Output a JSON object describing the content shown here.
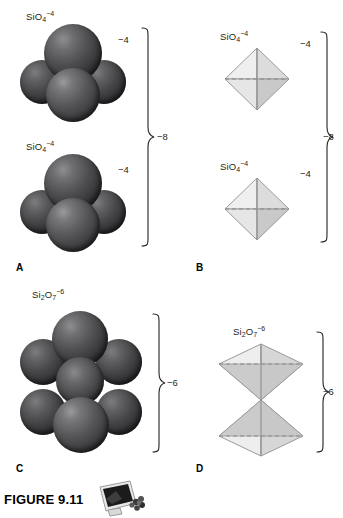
{
  "figure": {
    "caption_label": "FIGURE 9.11",
    "media_icon": "computer-monitor-icon"
  },
  "panels": [
    {
      "letter": "A",
      "kind": "space-filling-model",
      "units": [
        {
          "formula_html": "SiO<sub>4</sub><sup>−4</sup>",
          "charge": "−4"
        },
        {
          "formula_html": "SiO<sub>4</sub><sup>−4</sup>",
          "charge": "−4"
        }
      ],
      "group_charge": "−8"
    },
    {
      "letter": "B",
      "kind": "tetrahedron-diagram",
      "units": [
        {
          "formula_html": "SiO<sub>4</sub><sup>−4</sup>",
          "charge": "−4"
        },
        {
          "formula_html": "SiO<sub>4</sub><sup>−4</sup>",
          "charge": "−4"
        }
      ],
      "group_charge": "−8"
    },
    {
      "letter": "C",
      "kind": "space-filling-model",
      "units": [
        {
          "formula_html": "Si<sub>2</sub>O<sub>7</sub><sup>−6</sup>",
          "charge": ""
        }
      ],
      "group_charge": "−6"
    },
    {
      "letter": "D",
      "kind": "double-tetrahedron-diagram",
      "units": [
        {
          "formula_html": "Si<sub>2</sub>O<sub>7</sub><sup>−6</sup>",
          "charge": ""
        }
      ],
      "group_charge": "−6"
    }
  ],
  "colors": {
    "sphere_dark": "#3a3a3d",
    "sphere_highlight": "#9a9a9d",
    "tetra_light": "#f2f2f2",
    "tetra_mid": "#d8d8d8",
    "tetra_dark": "#bdbdbd",
    "outline": "#8c8c8c",
    "text": "#231f20"
  }
}
